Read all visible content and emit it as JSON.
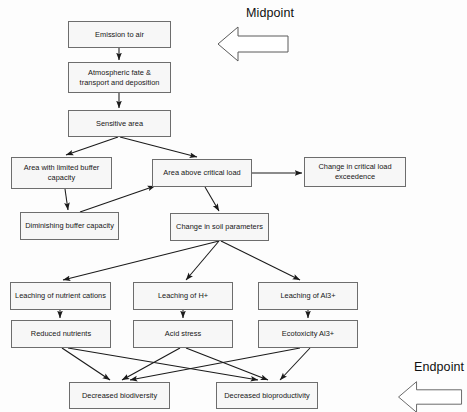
{
  "diagram": {
    "type": "flowchart",
    "width": 467,
    "height": 412,
    "box_fill": "#f7f7f7",
    "box_stroke": "#6d6d6d",
    "edge_color": "#1a1a1a",
    "text_color": "#161616"
  },
  "annotations": [
    {
      "id": "midpoint",
      "label": "Midpoint",
      "arrow_direction": "left"
    },
    {
      "id": "endpoint",
      "label": "Endpoint",
      "arrow_direction": "left"
    }
  ],
  "nodes": [
    {
      "id": "emission",
      "label": "Emission to air",
      "x": 68,
      "y": 21,
      "w": 103,
      "h": 27
    },
    {
      "id": "atmospheric",
      "label": "Atmospheric fate &\ntransport and deposition",
      "x": 68,
      "y": 62,
      "w": 103,
      "h": 31
    },
    {
      "id": "sensitive",
      "label": "Sensitive area",
      "x": 68,
      "y": 110,
      "w": 103,
      "h": 27
    },
    {
      "id": "limited_buffer",
      "label": "Area with limited buffer\ncapacity",
      "x": 11,
      "y": 157,
      "w": 101,
      "h": 32
    },
    {
      "id": "above_load",
      "label": "Area above critical load",
      "x": 152,
      "y": 159,
      "w": 100,
      "h": 28
    },
    {
      "id": "cl_exceedence",
      "label": "Change in critical load\nexceedence",
      "x": 304,
      "y": 157,
      "w": 102,
      "h": 30
    },
    {
      "id": "dim_buffer",
      "label": "Diminishing buffer capacity",
      "x": 20,
      "y": 212,
      "w": 99,
      "h": 28
    },
    {
      "id": "soil_params",
      "label": "Change in soil parameters",
      "x": 170,
      "y": 213,
      "w": 99,
      "h": 28
    },
    {
      "id": "leach_cations",
      "label": "Leaching of nutrient cations",
      "x": 10,
      "y": 282,
      "w": 101,
      "h": 28
    },
    {
      "id": "leach_h",
      "label": "Leaching of H+",
      "x": 133,
      "y": 282,
      "w": 100,
      "h": 28
    },
    {
      "id": "leach_al",
      "label": "Leaching of Al3+",
      "x": 258,
      "y": 282,
      "w": 100,
      "h": 28
    },
    {
      "id": "red_nutrients",
      "label": "Reduced nutrients",
      "x": 11,
      "y": 320,
      "w": 100,
      "h": 28
    },
    {
      "id": "acid_stress",
      "label": "Acid stress",
      "x": 133,
      "y": 320,
      "w": 100,
      "h": 28
    },
    {
      "id": "ecotox_al",
      "label": "Ecotoxicity Al3+",
      "x": 258,
      "y": 320,
      "w": 100,
      "h": 28
    },
    {
      "id": "biodiversity",
      "label": "Decreased biodiversity",
      "x": 69,
      "y": 382,
      "w": 101,
      "h": 27
    },
    {
      "id": "bioproductivity",
      "label": "Decreased bioproductivity",
      "x": 216,
      "y": 382,
      "w": 102,
      "h": 27
    }
  ],
  "edges": [
    {
      "from": "emission",
      "to": "atmospheric",
      "points": [
        [
          119,
          48
        ],
        [
          119,
          60
        ]
      ]
    },
    {
      "from": "atmospheric",
      "to": "sensitive",
      "points": [
        [
          119,
          93
        ],
        [
          119,
          108
        ]
      ]
    },
    {
      "from": "sensitive",
      "to": "limited_buffer",
      "points": [
        [
          118,
          137
        ],
        [
          66,
          155
        ]
      ]
    },
    {
      "from": "sensitive",
      "to": "above_load",
      "points": [
        [
          120,
          137
        ],
        [
          197,
          157
        ]
      ]
    },
    {
      "from": "limited_buffer",
      "to": "dim_buffer",
      "points": [
        [
          65,
          189
        ],
        [
          68,
          210
        ]
      ]
    },
    {
      "from": "dim_buffer",
      "to": "above_load",
      "points": [
        [
          80,
          212
        ],
        [
          155,
          186
        ]
      ]
    },
    {
      "from": "above_load",
      "to": "cl_exceedence",
      "points": [
        [
          252,
          173
        ],
        [
          302,
          173
        ]
      ]
    },
    {
      "from": "above_load",
      "to": "soil_params",
      "points": [
        [
          205,
          187
        ],
        [
          219,
          211
        ]
      ]
    },
    {
      "from": "soil_params",
      "to": "leach_cations",
      "points": [
        [
          219,
          241
        ],
        [
          63,
          280
        ]
      ]
    },
    {
      "from": "soil_params",
      "to": "leach_h",
      "points": [
        [
          219,
          241
        ],
        [
          186,
          280
        ]
      ]
    },
    {
      "from": "soil_params",
      "to": "leach_al",
      "points": [
        [
          221,
          241
        ],
        [
          300,
          280
        ]
      ]
    },
    {
      "from": "leach_cations",
      "to": "red_nutrients",
      "points": [
        [
          60,
          310
        ],
        [
          60,
          318
        ]
      ]
    },
    {
      "from": "leach_h",
      "to": "acid_stress",
      "points": [
        [
          183,
          310
        ],
        [
          183,
          318
        ]
      ]
    },
    {
      "from": "leach_al",
      "to": "ecotox_al",
      "points": [
        [
          308,
          310
        ],
        [
          308,
          318
        ]
      ]
    },
    {
      "from": "red_nutrients",
      "to": "biodiversity",
      "points": [
        [
          62,
          348
        ],
        [
          110,
          380
        ]
      ]
    },
    {
      "from": "red_nutrients",
      "to": "bioproductivity",
      "points": [
        [
          68,
          348
        ],
        [
          258,
          380
        ]
      ]
    },
    {
      "from": "acid_stress",
      "to": "biodiversity",
      "points": [
        [
          180,
          348
        ],
        [
          122,
          380
        ]
      ]
    },
    {
      "from": "acid_stress",
      "to": "bioproductivity",
      "points": [
        [
          186,
          348
        ],
        [
          268,
          380
        ]
      ]
    },
    {
      "from": "ecotox_al",
      "to": "biodiversity",
      "points": [
        [
          300,
          348
        ],
        [
          130,
          380
        ]
      ]
    },
    {
      "from": "ecotox_al",
      "to": "bioproductivity",
      "points": [
        [
          310,
          348
        ],
        [
          280,
          380
        ]
      ]
    }
  ]
}
